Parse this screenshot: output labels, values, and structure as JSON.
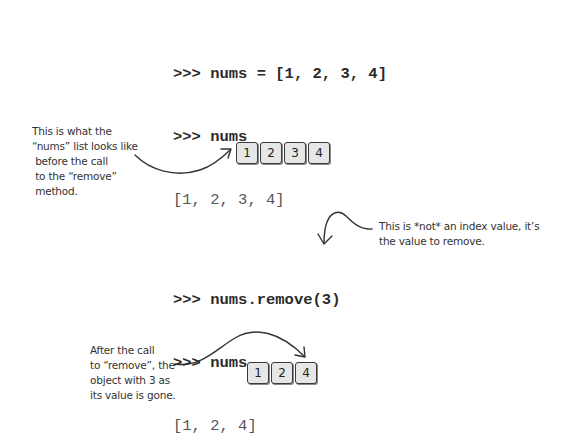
{
  "code_block_1": {
    "lines": [
      {
        "text": ">>> nums = [1, 2, 3, 4]",
        "kind": "input"
      },
      {
        "text": ">>> nums",
        "kind": "input"
      },
      {
        "text": "[1, 2, 3, 4]",
        "kind": "output"
      }
    ]
  },
  "annotation_before": {
    "text": "This is what the\n“nums” list looks like\n before the call\n to the “remove”\n method."
  },
  "list_before": {
    "items": [
      "1",
      "2",
      "3",
      "4"
    ]
  },
  "annotation_not_index": {
    "text": "This is *not* an index value, it’s\nthe value to remove."
  },
  "code_block_2": {
    "lines": [
      {
        "text": ">>> nums.remove(3)",
        "kind": "input"
      },
      {
        "text": ">>> nums",
        "kind": "input"
      },
      {
        "text": "[1, 2, 4]",
        "kind": "output"
      }
    ]
  },
  "annotation_after": {
    "text": "After the call\nto “remove”, the\nobject with 3 as\nits value is gone."
  },
  "list_after": {
    "items": [
      "1",
      "2",
      "4"
    ]
  },
  "colors": {
    "ink": "#333333",
    "box_fill": "#e6e6e6",
    "code_input": "#2b2b2b",
    "code_output": "#555555"
  }
}
